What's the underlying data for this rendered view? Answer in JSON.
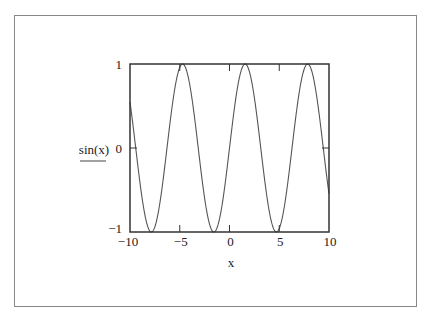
{
  "chart_data": {
    "type": "line",
    "title": "",
    "function": "sin(x)",
    "xlabel": "x",
    "ylabel": "sin(x)",
    "xlim": [
      -10,
      10
    ],
    "ylim": [
      -1,
      1
    ],
    "grid": false,
    "legend": "none",
    "x_ticks": [
      -10,
      -5,
      0,
      5,
      10
    ],
    "x_tick_labels": [
      "−10",
      "−5",
      "0",
      "5",
      "10"
    ],
    "y_ticks": [
      -1,
      0,
      1
    ],
    "y_tick_labels": [
      "−1",
      "0",
      "1"
    ],
    "series": [
      {
        "name": "sin(x)",
        "color": "#555555",
        "x": [
          -10,
          -9,
          -8,
          -7,
          -6,
          -5,
          -4,
          -3,
          -2,
          -1,
          0,
          1,
          2,
          3,
          4,
          5,
          6,
          7,
          8,
          9,
          10
        ],
        "y": [
          0.544,
          -0.412,
          -0.989,
          -0.657,
          0.279,
          0.959,
          0.757,
          -0.141,
          -0.909,
          -0.841,
          0,
          0.841,
          0.909,
          0.141,
          -0.757,
          -0.959,
          -0.279,
          0.657,
          0.989,
          0.412,
          -0.544
        ]
      }
    ],
    "colors": {
      "frame": "#333333",
      "border": "#888888"
    }
  }
}
